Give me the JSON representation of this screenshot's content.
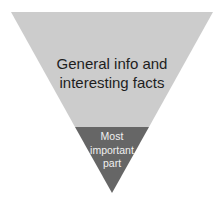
{
  "diagram": {
    "type": "inverted-pyramid",
    "colors": {
      "upper": "#cccccc",
      "lower": "#666666",
      "background": "#ffffff"
    },
    "sections": [
      {
        "name": "upper",
        "lines": [
          "General info and",
          "interesting facts"
        ]
      },
      {
        "name": "lower",
        "lines": [
          "Most",
          "important",
          "part"
        ]
      }
    ]
  }
}
